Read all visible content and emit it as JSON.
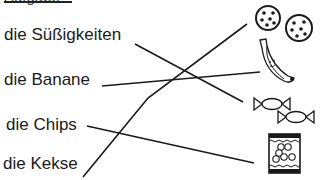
{
  "worksheet": {
    "heading": "Aufgabe",
    "words": [
      {
        "label": "die Süßigkeiten"
      },
      {
        "label": "die Banane"
      },
      {
        "label": "die Chips"
      },
      {
        "label": "die Kekse"
      }
    ],
    "pictures": [
      {
        "icon": "cookies-icon"
      },
      {
        "icon": "banana-icon"
      },
      {
        "icon": "candies-icon"
      },
      {
        "icon": "chips-bag-icon"
      }
    ],
    "connections": [
      {
        "from": "die Süßigkeiten",
        "to": "candies-icon"
      },
      {
        "from": "die Banane",
        "to": "banana-icon"
      },
      {
        "from": "die Chips",
        "to": "chips-bag-icon"
      },
      {
        "from": "die Kekse",
        "to": "cookies-icon"
      }
    ],
    "line_color": "#1a1a1a"
  }
}
